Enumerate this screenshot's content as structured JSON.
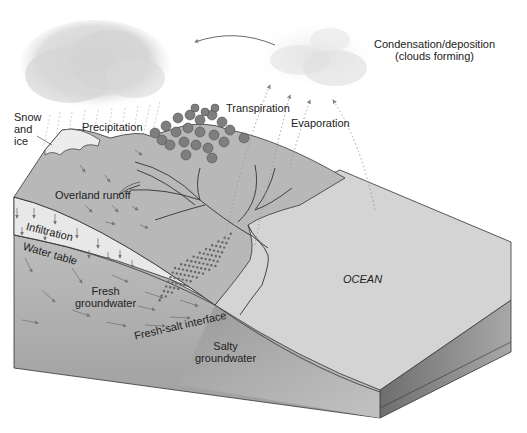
{
  "diagram": {
    "type": "water-cycle-block-diagram",
    "labels": {
      "condensation_line1": "Condensation/deposition",
      "condensation_line2": "(clouds forming)",
      "snow_line1": "Snow",
      "snow_line2": "and",
      "snow_line3": "ice",
      "precipitation": "Precipitation",
      "transpiration": "Transpiration",
      "evaporation": "Evaporation",
      "overland_runoff": "Overland runoff",
      "infiltration": "Infiltration",
      "water_table": "Water table",
      "fresh_groundwater_line1": "Fresh",
      "fresh_groundwater_line2": "groundwater",
      "fresh_salt_interface": "Fresh-salt interface",
      "salty_groundwater_line1": "Salty",
      "salty_groundwater_line2": "groundwater",
      "ocean": "OCEAN"
    },
    "colors": {
      "land_surface": "#b9b9b9",
      "ocean_surface": "#d6d6d6",
      "infiltration_zone": "#e6e6e6",
      "groundwater_zone": "#bdbdbd",
      "salty_zone": "#a6a6a6",
      "block_side_dark": "#8a8a8a",
      "tree": "#7b7b7b",
      "outline": "#333333",
      "arrow": "#777777"
    }
  }
}
